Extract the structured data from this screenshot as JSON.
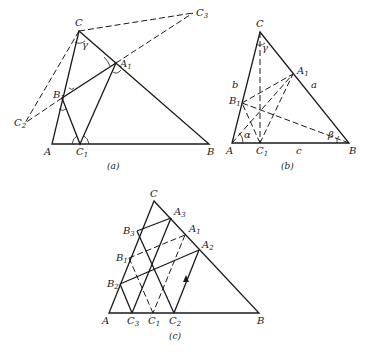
{
  "figures": [
    {
      "id": "a",
      "caption": "(a)",
      "labels": {
        "C": "C",
        "C3": "C",
        "C3_sub": "3",
        "A1": "A",
        "A1_sub": "1",
        "B1": "B",
        "B1_sub": "1",
        "C2": "C",
        "C2_sub": "2",
        "A": "A",
        "C1": "C",
        "C1_sub": "1",
        "B": "B",
        "gamma": "γ"
      }
    },
    {
      "id": "b",
      "caption": "(b)",
      "labels": {
        "C": "C",
        "A1": "A",
        "A1_sub": "1",
        "B1": "B",
        "B1_sub": "1",
        "A": "A",
        "C1": "C",
        "C1_sub": "1",
        "B": "B",
        "a": "a",
        "b": "b",
        "c": "c",
        "alpha": "α",
        "beta": "β",
        "gamma": "γ"
      }
    },
    {
      "id": "c",
      "caption": "(c)",
      "labels": {
        "C": "C",
        "A3": "A",
        "A3_sub": "3",
        "A1": "A",
        "A1_sub": "1",
        "A2": "A",
        "A2_sub": "2",
        "B3": "B",
        "B3_sub": "3",
        "B1": "B",
        "B1_sub": "1",
        "B2": "B",
        "B2_sub": "2",
        "A": "A",
        "C3": "C",
        "C3_sub": "3",
        "C1": "C",
        "C1_sub": "1",
        "C2": "C",
        "C2_sub": "2",
        "B": "B"
      }
    }
  ]
}
